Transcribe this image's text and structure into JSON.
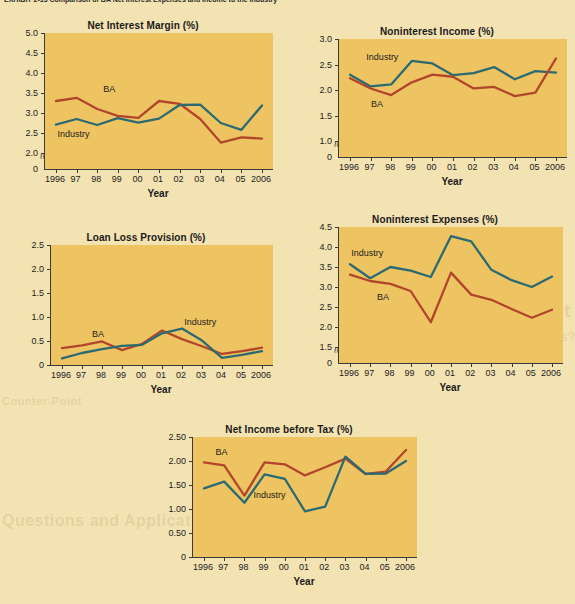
{
  "caption": "EXHIBIT 2-13   Comparison of BA Net Interest Expenses and Income to the Industry",
  "legend": {
    "series_a": "BA",
    "series_b": "Industry"
  },
  "colors": {
    "ba_line": "#b1462c",
    "industry_line": "#2b6a72",
    "plot_background": "#eec462",
    "page_background": "#f3e2b2",
    "axis": "#3a3a3a",
    "text": "#1a1a1a"
  },
  "bleed_text": [
    {
      "text": "Point Counterpoint",
      "x": 390,
      "y": 300,
      "size": 19
    },
    {
      "text": "Who Should Regulate Banks?",
      "x": 392,
      "y": 330,
      "size": 12
    },
    {
      "text": "Counter-Point",
      "x": 2,
      "y": 395,
      "size": 11
    },
    {
      "text": "Questions and Applications",
      "x": 2,
      "y": 512,
      "size": 16
    }
  ],
  "xaxis_title": "Year",
  "categories": [
    "1996",
    "97",
    "98",
    "99",
    "00",
    "01",
    "02",
    "03",
    "04",
    "05",
    "2006"
  ],
  "chart_data": [
    {
      "id": "net-interest-margin",
      "type": "line",
      "title": "Net Interest Margin (%)",
      "xlabel": "Year",
      "ylabel": "",
      "categories": [
        "1996",
        "97",
        "98",
        "99",
        "00",
        "01",
        "02",
        "03",
        "04",
        "05",
        "2006"
      ],
      "yticks": [
        "2.0",
        "2.5",
        "3.0",
        "3.5",
        "4.0",
        "4.5",
        "5.0"
      ],
      "ytick_values": [
        2.0,
        2.5,
        3.0,
        3.5,
        4.0,
        4.5,
        5.0
      ],
      "ylim": [
        2.0,
        5.0
      ],
      "axis_break": true,
      "zero_label": "0",
      "grid": false,
      "legend_position": "inline",
      "series": [
        {
          "name": "BA",
          "color": "#b1462c",
          "values": [
            3.3,
            3.38,
            3.1,
            2.93,
            2.88,
            3.3,
            3.23,
            2.85,
            2.26,
            2.39,
            2.36
          ],
          "label_x": 0.255,
          "label_y": 3.58
        },
        {
          "name": "Industry",
          "color": "#2b6a72",
          "values": [
            2.71,
            2.85,
            2.7,
            2.87,
            2.76,
            2.86,
            3.2,
            3.21,
            2.75,
            2.58,
            3.19
          ],
          "label_x": 0.055,
          "label_y": 2.45
        }
      ]
    },
    {
      "id": "noninterest-income",
      "type": "line",
      "title": "Noninterest Income (%)",
      "xlabel": "Year",
      "ylabel": "",
      "categories": [
        "1996",
        "97",
        "98",
        "99",
        "00",
        "01",
        "02",
        "03",
        "04",
        "05",
        "2006"
      ],
      "yticks": [
        "1.0",
        "1.5",
        "2.0",
        "2.5",
        "3.0"
      ],
      "ytick_values": [
        1.0,
        1.5,
        2.0,
        2.5,
        3.0
      ],
      "ylim": [
        1.0,
        3.0
      ],
      "axis_break": true,
      "zero_label": "0",
      "grid": false,
      "legend_position": "inline",
      "series": [
        {
          "name": "Industry",
          "color": "#2b6a72",
          "values": [
            2.3,
            2.07,
            2.11,
            2.57,
            2.52,
            2.29,
            2.33,
            2.45,
            2.21,
            2.37,
            2.34
          ],
          "label_x": 0.12,
          "label_y": 2.62
        },
        {
          "name": "BA",
          "color": "#b1462c",
          "values": [
            2.23,
            2.03,
            1.9,
            2.15,
            2.3,
            2.26,
            2.03,
            2.06,
            1.88,
            1.95,
            2.62
          ],
          "label_x": 0.14,
          "label_y": 1.7
        }
      ]
    },
    {
      "id": "loan-loss-provision",
      "type": "line",
      "title": "Loan Loss Provision (%)",
      "xlabel": "Year",
      "ylabel": "",
      "categories": [
        "1996",
        "97",
        "98",
        "99",
        "00",
        "01",
        "02",
        "03",
        "04",
        "05",
        "2006"
      ],
      "yticks": [
        "0",
        "0.5",
        "1.0",
        "1.5",
        "2.0",
        "2.5"
      ],
      "ytick_values": [
        0,
        0.5,
        1.0,
        1.5,
        2.0,
        2.5
      ],
      "ylim": [
        0,
        2.5
      ],
      "axis_break": false,
      "zero_label": "0",
      "grid": false,
      "legend_position": "inline",
      "series": [
        {
          "name": "BA",
          "color": "#b1462c",
          "values": [
            0.35,
            0.41,
            0.49,
            0.31,
            0.44,
            0.72,
            0.54,
            0.39,
            0.23,
            0.29,
            0.36
          ],
          "label_x": 0.185,
          "label_y": 0.62
        },
        {
          "name": "Industry",
          "color": "#2b6a72",
          "values": [
            0.14,
            0.25,
            0.33,
            0.4,
            0.42,
            0.66,
            0.76,
            0.51,
            0.15,
            0.21,
            0.29
          ],
          "label_x": 0.6,
          "label_y": 0.88
        }
      ]
    },
    {
      "id": "noninterest-expenses",
      "type": "line",
      "title": "Noninterest Expenses (%)",
      "xlabel": "Year",
      "ylabel": "",
      "categories": [
        "1996",
        "97",
        "98",
        "99",
        "00",
        "01",
        "02",
        "03",
        "04",
        "05",
        "2006"
      ],
      "yticks": [
        "1.5",
        "2.0",
        "2.5",
        "3.0",
        "3.5",
        "4.0",
        "4.5"
      ],
      "ytick_values": [
        1.5,
        2.0,
        2.5,
        3.0,
        3.5,
        4.0,
        4.5
      ],
      "ylim": [
        1.5,
        4.5
      ],
      "axis_break": true,
      "zero_label": "0",
      "grid": false,
      "legend_position": "inline",
      "series": [
        {
          "name": "Industry",
          "color": "#2b6a72",
          "values": [
            3.57,
            3.22,
            3.5,
            3.41,
            3.25,
            4.27,
            4.14,
            3.43,
            3.17,
            3.0,
            3.26
          ],
          "label_x": 0.055,
          "label_y": 3.82
        },
        {
          "name": "BA",
          "color": "#b1462c",
          "values": [
            3.31,
            3.15,
            3.08,
            2.9,
            2.12,
            3.36,
            2.81,
            2.68,
            2.45,
            2.23,
            2.43
          ],
          "label_x": 0.17,
          "label_y": 2.72
        }
      ]
    },
    {
      "id": "net-income-before-tax",
      "type": "line",
      "title": "Net Income before Tax (%)",
      "xlabel": "Year",
      "ylabel": "",
      "categories": [
        "1996",
        "97",
        "98",
        "99",
        "00",
        "01",
        "02",
        "03",
        "04",
        "05",
        "2006"
      ],
      "yticks": [
        "0",
        "0.50",
        "1.00",
        "1.50",
        "2.00",
        "2.50"
      ],
      "ytick_values": [
        0,
        0.5,
        1.0,
        1.5,
        2.0,
        2.5
      ],
      "ylim": [
        0,
        2.5
      ],
      "axis_break": false,
      "zero_label": "0",
      "grid": false,
      "legend_position": "inline",
      "series": [
        {
          "name": "BA",
          "color": "#b1462c",
          "values": [
            1.97,
            1.91,
            1.28,
            1.97,
            1.93,
            1.7,
            1.87,
            2.05,
            1.73,
            1.78,
            2.23
          ],
          "label_x": 0.1,
          "label_y": 2.17
        },
        {
          "name": "Industry",
          "color": "#2b6a72",
          "values": [
            1.43,
            1.57,
            1.13,
            1.72,
            1.63,
            0.95,
            1.05,
            2.09,
            1.73,
            1.74,
            2.0
          ],
          "label_x": 0.27,
          "label_y": 1.27
        }
      ]
    }
  ],
  "layout": [
    {
      "left": 12,
      "top": 20,
      "pw": 228,
      "ph": 136
    },
    {
      "left": 306,
      "top": 26,
      "pw": 228,
      "ph": 118
    },
    {
      "left": 18,
      "top": 232,
      "pw": 222,
      "ph": 120
    },
    {
      "left": 306,
      "top": 214,
      "pw": 224,
      "ph": 136
    },
    {
      "left": 160,
      "top": 424,
      "pw": 224,
      "ph": 120
    }
  ]
}
